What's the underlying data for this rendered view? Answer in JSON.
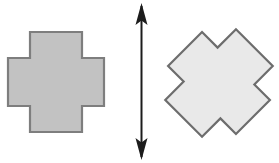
{
  "figure": {
    "background_color": "#ffffff",
    "width": 279,
    "height": 163
  },
  "shapes": [
    {
      "id": "left-cross",
      "name": "greek-cross-upright",
      "label": "Upright plus-shaped cross",
      "type": "polygon",
      "fill_color": "#c2c2c2",
      "stroke_color": "#7e7e7e",
      "stroke_width": 2.2,
      "rotation_degrees": 0,
      "center": {
        "x": 56,
        "y": 82
      },
      "bounds": {
        "x": 8,
        "y": 32,
        "width": 96,
        "height": 100
      },
      "arm_span_horizontal": [
        8,
        104
      ],
      "arm_span_vertical": [
        32,
        132
      ],
      "arm_width": 52,
      "points": "30,32 82,32 82,58 104,58 104,106 82,106 82,132 30,132 30,106 8,106 8,58 30,58"
    },
    {
      "id": "right-cross",
      "name": "greek-cross-rotated",
      "label": "Same cross rotated 45 degrees",
      "type": "polygon",
      "fill_color": "#e9e9e9",
      "stroke_color": "#6d6d6d",
      "stroke_width": 2.2,
      "rotation_degrees": 45,
      "center": {
        "x": 219,
        "y": 83
      },
      "bounds": {
        "x": 166,
        "y": 29,
        "width": 106,
        "height": 108
      },
      "extreme_left_x": 166,
      "extreme_right_x": 272,
      "extreme_top_y": 29,
      "extreme_bottom_y": 137,
      "arm_width": 52,
      "points": "30,32 82,32 82,58 104,58 104,106 82,106 82,132 30,132 30,106 8,106 8,58 30,58"
    }
  ],
  "arrow": {
    "id": "vertical-axis-arrow",
    "name": "double-headed-vertical-arrow",
    "label": "Vertical double-headed axis arrow",
    "color": "#1c1c1c",
    "x": 141.5,
    "y_top": 3,
    "y_bottom": 160,
    "shaft_width": 2.0,
    "head_length": 22,
    "head_half_width": 6,
    "heads": [
      "up",
      "down"
    ]
  }
}
